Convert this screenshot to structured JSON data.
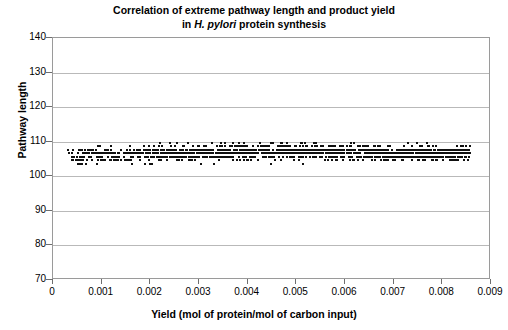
{
  "chart_data": {
    "type": "scatter",
    "title": "Correlation of extreme pathway length and product yield in H. pylori protein synthesis",
    "title_line1": "Correlation of extreme pathway length and product yield",
    "title_line2_prefix": "in ",
    "title_line2_italic": "H. pylori",
    "title_line2_suffix": " protein synthesis",
    "xlabel": "Yield (mol of protein/mol of carbon input)",
    "ylabel": "Pathway length",
    "xlim": [
      0,
      0.009
    ],
    "ylim": [
      70,
      140
    ],
    "xticks": [
      0,
      0.001,
      0.002,
      0.003,
      0.004,
      0.005,
      0.006,
      0.007,
      0.008,
      0.009
    ],
    "xtick_labels": [
      "0",
      "0.001",
      "0.002",
      "0.003",
      "0.004",
      "0.005",
      "0.006",
      "0.007",
      "0.008",
      "0.009"
    ],
    "yticks": [
      70,
      80,
      90,
      100,
      110,
      120,
      130,
      140
    ],
    "ytick_labels": [
      "70",
      "80",
      "90",
      "100",
      "110",
      "120",
      "130",
      "140"
    ],
    "grid": "horizontal",
    "legend": "none",
    "marker": "square",
    "marker_color": "#101010",
    "marker_size_px": 2,
    "series_name": "extreme pathways",
    "point_count": 1600,
    "data_extent": {
      "x_min": 0.00028,
      "x_max": 0.00855,
      "y_min": 99,
      "y_max": 113,
      "y_dense_min": 102,
      "y_dense_max": 111
    }
  },
  "colors": {
    "axis": "#9a9a9a",
    "grid": "#b9b9b9",
    "marker": "#101010",
    "background": "#ffffff",
    "text": "#000000"
  }
}
